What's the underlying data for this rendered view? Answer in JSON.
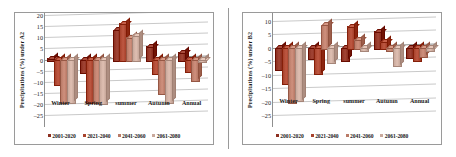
{
  "figure": {
    "panels": [
      "A2",
      "B2"
    ]
  },
  "series_colors": [
    "#8c2f20",
    "#a8422c",
    "#b97a67",
    "#c9a99c"
  ],
  "legend": {
    "items": [
      {
        "label": "2001-2020",
        "color": "#8c2f20"
      },
      {
        "label": "2021-2040",
        "color": "#a8422c"
      },
      {
        "label": "2041-2060",
        "color": "#b97a67"
      },
      {
        "label": "2061-2080",
        "color": "#c9a99c"
      }
    ]
  },
  "chart_data": [
    {
      "type": "bar",
      "title": "",
      "panel": "A2",
      "xlabel": "",
      "ylabel": "Precipitations (%) under A2",
      "categories": [
        "Winter",
        "Spring",
        "summer",
        "Autumn",
        "Annual"
      ],
      "yticks": [
        20,
        15,
        10,
        5,
        0,
        -5,
        -10,
        -15,
        -20,
        -25
      ],
      "ylim": [
        -25,
        20
      ],
      "grid": true,
      "legend_position": "bottom",
      "series": [
        {
          "name": "2001-2020",
          "values": [
            0.5,
            -5.5,
            13.5,
            6.0,
            3.5
          ]
        },
        {
          "name": "2021-2040",
          "values": [
            -11.0,
            -19.0,
            16.5,
            -6.0,
            -5.0
          ]
        },
        {
          "name": "2041-2060",
          "values": [
            -19.0,
            -19.0,
            10.0,
            -15.0,
            -9.0
          ]
        },
        {
          "name": "2061-2080",
          "values": [
            -19.0,
            -19.5,
            11.0,
            -19.0,
            -0.5
          ]
        }
      ]
    },
    {
      "type": "bar",
      "title": "",
      "panel": "B2",
      "xlabel": "",
      "ylabel": "Precipitations (%) under B2",
      "categories": [
        "Winter",
        "Spring",
        "summer",
        "Autumn",
        "Annual"
      ],
      "yticks": [
        10,
        5,
        0,
        -5,
        -10,
        -15,
        -20,
        -25
      ],
      "ylim": [
        -25,
        12
      ],
      "grid": true,
      "legend_position": "bottom",
      "series": [
        {
          "name": "2001-2020",
          "values": [
            -8.0,
            -4.0,
            -4.5,
            6.0,
            -3.5
          ]
        },
        {
          "name": "2021-2040",
          "values": [
            -13.0,
            -9.5,
            8.0,
            2.5,
            -4.5
          ]
        },
        {
          "name": "2041-2060",
          "values": [
            -20.0,
            8.5,
            3.0,
            -1.0,
            -3.0
          ]
        },
        {
          "name": "2061-2080",
          "values": [
            -19.5,
            -5.5,
            -1.0,
            -6.5,
            -0.8
          ]
        }
      ]
    }
  ]
}
